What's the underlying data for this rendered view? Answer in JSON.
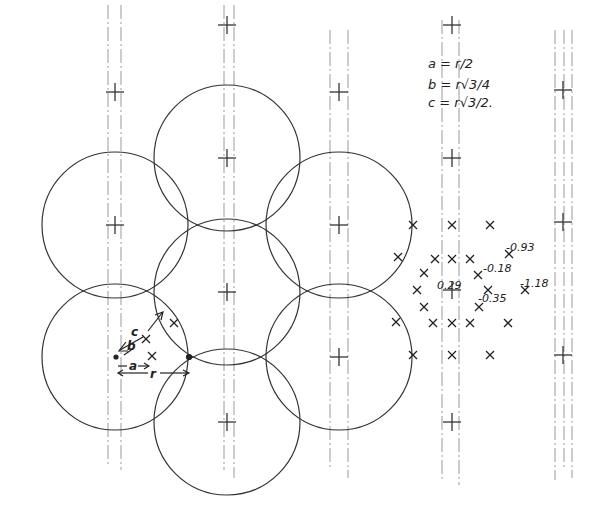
{
  "diagram": {
    "type": "hexagonal-circle-cluster",
    "ink_color": "#333333",
    "faint_color": "#9a9a9a",
    "circle_radius": 73,
    "circles": [
      {
        "cx": 227,
        "cy": 158
      },
      {
        "cx": 115,
        "cy": 225
      },
      {
        "cx": 339,
        "cy": 225
      },
      {
        "cx": 227,
        "cy": 292
      },
      {
        "cx": 115,
        "cy": 357
      },
      {
        "cx": 339,
        "cy": 357
      },
      {
        "cx": 227,
        "cy": 422
      }
    ],
    "crosshairs": [
      {
        "x": 115,
        "y": 92
      },
      {
        "x": 227,
        "y": 25
      },
      {
        "x": 339,
        "y": 92
      },
      {
        "x": 452,
        "y": 25
      },
      {
        "x": 563,
        "y": 90
      },
      {
        "x": 227,
        "y": 158
      },
      {
        "x": 452,
        "y": 158
      },
      {
        "x": 115,
        "y": 225
      },
      {
        "x": 339,
        "y": 225
      },
      {
        "x": 563,
        "y": 222
      },
      {
        "x": 227,
        "y": 292
      },
      {
        "x": 452,
        "y": 290
      },
      {
        "x": 339,
        "y": 357
      },
      {
        "x": 563,
        "y": 355
      },
      {
        "x": 227,
        "y": 422
      },
      {
        "x": 452,
        "y": 422
      }
    ],
    "vertical_lines": [
      {
        "x": 108,
        "y1": 5,
        "y2": 465
      },
      {
        "x": 121,
        "y1": 5,
        "y2": 470
      },
      {
        "x": 224,
        "y1": 5,
        "y2": 470
      },
      {
        "x": 234,
        "y1": 5,
        "y2": 478
      },
      {
        "x": 330,
        "y1": 30,
        "y2": 470
      },
      {
        "x": 348,
        "y1": 30,
        "y2": 478
      },
      {
        "x": 442,
        "y1": 20,
        "y2": 480
      },
      {
        "x": 459,
        "y1": 20,
        "y2": 485
      },
      {
        "x": 555,
        "y1": 30,
        "y2": 480
      },
      {
        "x": 564,
        "y1": 30,
        "y2": 470
      },
      {
        "x": 572,
        "y1": 30,
        "y2": 478
      }
    ],
    "legend": {
      "lines": [
        "a =  r/2",
        "b =  r√3/4",
        "c =  r√3/2."
      ]
    },
    "dimensions": {
      "a_label": "a",
      "b_label": "b",
      "c_label": "c",
      "r_label": "r"
    },
    "markers": [
      {
        "x": 174,
        "y": 323
      },
      {
        "x": 152,
        "y": 356
      },
      {
        "x": 146,
        "y": 339
      },
      {
        "x": 413,
        "y": 225
      },
      {
        "x": 452,
        "y": 225
      },
      {
        "x": 490,
        "y": 225
      },
      {
        "x": 398,
        "y": 257
      },
      {
        "x": 435,
        "y": 259
      },
      {
        "x": 452,
        "y": 259
      },
      {
        "x": 470,
        "y": 259
      },
      {
        "x": 509,
        "y": 254
      },
      {
        "x": 424,
        "y": 273
      },
      {
        "x": 478,
        "y": 275
      },
      {
        "x": 417,
        "y": 290
      },
      {
        "x": 488,
        "y": 290
      },
      {
        "x": 525,
        "y": 290
      },
      {
        "x": 424,
        "y": 307
      },
      {
        "x": 479,
        "y": 307
      },
      {
        "x": 396,
        "y": 322
      },
      {
        "x": 433,
        "y": 323
      },
      {
        "x": 452,
        "y": 323
      },
      {
        "x": 470,
        "y": 323
      },
      {
        "x": 508,
        "y": 323
      },
      {
        "x": 413,
        "y": 355
      },
      {
        "x": 452,
        "y": 355
      },
      {
        "x": 490,
        "y": 355
      }
    ],
    "value_labels": [
      {
        "text": "0.29",
        "x": 437,
        "y": 289
      },
      {
        "text": "-0.18",
        "x": 483,
        "y": 272
      },
      {
        "text": "-0.93",
        "x": 506,
        "y": 251
      },
      {
        "text": "-1.18",
        "x": 520,
        "y": 287
      },
      {
        "text": "-0.35",
        "x": 478,
        "y": 302
      }
    ]
  }
}
